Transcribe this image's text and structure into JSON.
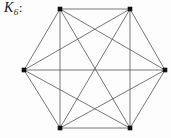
{
  "figure": {
    "width": 171,
    "height": 138,
    "background_color": "#fdfdfd"
  },
  "label": {
    "base": "K",
    "subscript": "6",
    "punctuation": ":",
    "full_text": "K6:",
    "color": "#1a1a1a"
  },
  "chart_data": {
    "type": "diagram",
    "diagram_kind": "graph",
    "title": "K6:",
    "vertex_count": 6,
    "edge_count": 15,
    "vertex_color": "#111111",
    "vertex_size": 4.6,
    "edge_color": "#555555",
    "edge_width": 0.8,
    "vertices": [
      {
        "id": "v1",
        "x": 60,
        "y": 9
      },
      {
        "id": "v2",
        "x": 130,
        "y": 9
      },
      {
        "id": "v3",
        "x": 165,
        "y": 70
      },
      {
        "id": "v4",
        "x": 130,
        "y": 128
      },
      {
        "id": "v5",
        "x": 60,
        "y": 128
      },
      {
        "id": "v6",
        "x": 24,
        "y": 70
      }
    ],
    "edges": [
      {
        "from": "v1",
        "to": "v2"
      },
      {
        "from": "v1",
        "to": "v3"
      },
      {
        "from": "v1",
        "to": "v4"
      },
      {
        "from": "v1",
        "to": "v5"
      },
      {
        "from": "v1",
        "to": "v6"
      },
      {
        "from": "v2",
        "to": "v3"
      },
      {
        "from": "v2",
        "to": "v4"
      },
      {
        "from": "v2",
        "to": "v5"
      },
      {
        "from": "v2",
        "to": "v6"
      },
      {
        "from": "v3",
        "to": "v4"
      },
      {
        "from": "v3",
        "to": "v5"
      },
      {
        "from": "v3",
        "to": "v6"
      },
      {
        "from": "v4",
        "to": "v5"
      },
      {
        "from": "v4",
        "to": "v6"
      },
      {
        "from": "v5",
        "to": "v6"
      }
    ]
  }
}
